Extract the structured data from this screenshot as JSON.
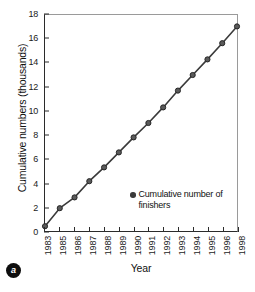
{
  "figure": {
    "panel_label": "a"
  },
  "legend": {
    "entries": [
      {
        "label": "Cumulative number of finishers",
        "color": "#4d4d4d",
        "marker": "circle"
      }
    ],
    "position": "inside-lower-right"
  },
  "chart_data": {
    "type": "line",
    "title": "",
    "xlabel": "Year",
    "ylabel": "Cumulative numbers (thousands)",
    "categories": [
      "1983",
      "1985",
      "1986",
      "1987",
      "1988",
      "1989",
      "1990",
      "1991",
      "1992",
      "1993",
      "1994",
      "1995",
      "1996",
      "1998"
    ],
    "x_tick_labels": [
      "1983",
      "1985",
      "1986",
      "1987",
      "1988",
      "1989",
      "1990",
      "1991",
      "1992",
      "1993",
      "1994",
      "1995",
      "1996",
      "1998"
    ],
    "y_tick_labels": [
      "0",
      "2",
      "4",
      "6",
      "8",
      "10",
      "12",
      "14",
      "16",
      "18"
    ],
    "y_ticks": [
      0,
      2,
      4,
      6,
      8,
      10,
      12,
      14,
      16,
      18
    ],
    "ylim": [
      0,
      18
    ],
    "grid": false,
    "series": [
      {
        "name": "Cumulative number of finishers",
        "color": "#3a3a3a",
        "marker": "circle",
        "values": [
          0.4,
          1.9,
          2.8,
          4.15,
          5.3,
          6.55,
          7.8,
          9.0,
          10.3,
          11.7,
          13.0,
          14.3,
          15.65,
          17.05
        ]
      }
    ]
  }
}
